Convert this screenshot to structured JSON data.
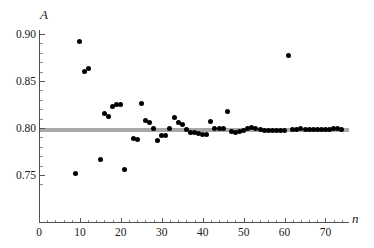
{
  "chart_data": {
    "type": "scatter",
    "title": "",
    "xlabel": "n",
    "ylabel": "A",
    "xlim": [
      0,
      75.5
    ],
    "ylim": [
      0.7355,
      0.905
    ],
    "grid": false,
    "legend": null,
    "xticks": [
      0,
      10,
      20,
      30,
      40,
      50,
      60,
      70
    ],
    "xtick_labels": [
      "0",
      "10",
      "20",
      "30",
      "40",
      "50",
      "60",
      "70"
    ],
    "yticks": [
      0.75,
      0.8,
      0.85,
      0.9
    ],
    "ytick_labels": [
      "0.75",
      "0.80",
      "0.85",
      "0.90"
    ],
    "xminor_step": 2,
    "yminor_step": 0.01,
    "marker": "filled-circle",
    "marker_color": "#000000",
    "marker_size_px": 5,
    "reference_line": {
      "orientation": "horizontal",
      "value": 0.7975,
      "color": "#a8a8a8",
      "thickness_px": 4
    },
    "x": [
      9,
      10,
      11,
      12,
      15,
      16,
      17,
      18,
      19,
      20,
      21,
      23,
      24,
      25,
      26,
      27,
      28,
      29,
      30,
      31,
      32,
      33,
      34,
      35,
      36,
      37,
      38,
      39,
      40,
      41,
      42,
      43,
      44,
      45,
      46,
      47,
      48,
      49,
      50,
      51,
      52,
      53,
      54,
      55,
      56,
      57,
      58,
      59,
      60,
      61,
      62,
      63,
      64,
      65,
      66,
      67,
      68,
      69,
      70,
      71,
      72,
      73,
      74
    ],
    "y": [
      0.7513,
      0.8918,
      0.8602,
      0.8632,
      0.7666,
      0.8149,
      0.8123,
      0.823,
      0.8252,
      0.8249,
      0.7557,
      0.7889,
      0.7879,
      0.8262,
      0.8083,
      0.8058,
      0.7999,
      0.7862,
      0.7916,
      0.7918,
      0.7999,
      0.8115,
      0.8062,
      0.8042,
      0.7982,
      0.7955,
      0.7949,
      0.7944,
      0.7936,
      0.7934,
      0.8072,
      0.7999,
      0.7997,
      0.7995,
      0.818,
      0.7963,
      0.7957,
      0.7962,
      0.7971,
      0.7994,
      0.8003,
      0.7991,
      0.7982,
      0.7975,
      0.797,
      0.797,
      0.7974,
      0.7976,
      0.7978,
      0.8774,
      0.7979,
      0.7988,
      0.799,
      0.7987,
      0.7985,
      0.7983,
      0.7983,
      0.7984,
      0.7985,
      0.7986,
      0.7993,
      0.799,
      0.7984
    ]
  },
  "axis": {
    "y_title": "A",
    "x_title": "n"
  }
}
